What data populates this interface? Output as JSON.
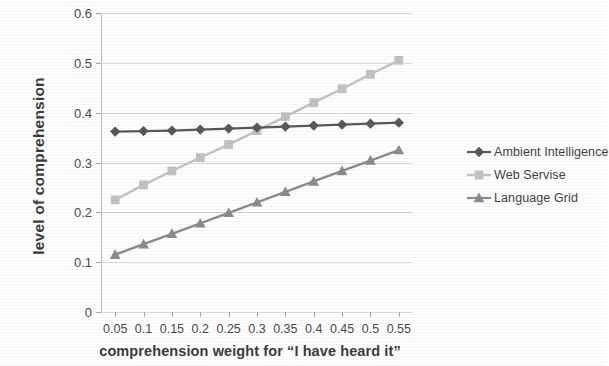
{
  "chart_data": {
    "type": "line",
    "title": "",
    "xlabel": "comprehension weight for “I have heard it”",
    "ylabel": "level of comprehension",
    "x": [
      0.05,
      0.1,
      0.15,
      0.2,
      0.25,
      0.3,
      0.35,
      0.4,
      0.45,
      0.5,
      0.55
    ],
    "xtick_labels": [
      "0.05",
      "0.1",
      "0.15",
      "0.2",
      "0.25",
      "0.3",
      "0.35",
      "0.4",
      "0.45",
      "0.5",
      "0.55"
    ],
    "ytick_labels": [
      "0",
      "0.1",
      "0.2",
      "0.3",
      "0.4",
      "0.5",
      "0.6"
    ],
    "ytick_values": [
      0,
      0.1,
      0.2,
      0.3,
      0.4,
      0.5,
      0.6
    ],
    "xlim": [
      0.025,
      0.575
    ],
    "ylim": [
      0,
      0.6
    ],
    "grid": true,
    "legend_position": "right",
    "series": [
      {
        "name": "Ambient Intelligence",
        "color": "#595959",
        "marker": "diamond",
        "values": [
          0.362,
          0.363,
          0.364,
          0.366,
          0.368,
          0.37,
          0.372,
          0.374,
          0.376,
          0.378,
          0.38
        ]
      },
      {
        "name": "Web Servise",
        "color": "#c2c2c2",
        "marker": "square",
        "values": [
          0.225,
          0.255,
          0.283,
          0.31,
          0.336,
          0.364,
          0.392,
          0.42,
          0.448,
          0.477,
          0.505
        ]
      },
      {
        "name": "Language Grid",
        "color": "#8c8c8c",
        "marker": "triangle",
        "values": [
          0.115,
          0.136,
          0.157,
          0.178,
          0.199,
          0.22,
          0.241,
          0.262,
          0.283,
          0.304,
          0.325
        ]
      }
    ]
  },
  "legend": {
    "items": [
      {
        "label": "Ambient Intelligence"
      },
      {
        "label": "Web Servise"
      },
      {
        "label": "Language Grid"
      }
    ]
  }
}
